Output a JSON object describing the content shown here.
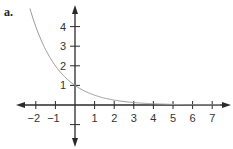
{
  "figure_label": "a.",
  "chart_data": {
    "type": "line",
    "title": "",
    "function": "y = (1/2)^x",
    "xlabel": "",
    "ylabel": "",
    "x_ticks": [
      -2,
      -1,
      1,
      2,
      3,
      4,
      5,
      6,
      7
    ],
    "y_ticks": [
      -1,
      1,
      2,
      3,
      4
    ],
    "xlim": [
      -3,
      7.8
    ],
    "ylim": [
      -2.2,
      5.0
    ],
    "grid": false,
    "legend": null,
    "series": [
      {
        "name": "curve",
        "x": [
          -2.3,
          -2,
          -1.5,
          -1,
          -0.5,
          0,
          0.5,
          1,
          1.5,
          2,
          3,
          4,
          5,
          6,
          7.4
        ],
        "y": [
          4.92,
          4,
          2.83,
          2,
          1.41,
          1,
          0.71,
          0.5,
          0.35,
          0.25,
          0.125,
          0.0625,
          0.031,
          0.016,
          0.006
        ]
      }
    ],
    "colors": {
      "axis": "#2a2a2a",
      "curve": "#9a9a9a"
    }
  }
}
